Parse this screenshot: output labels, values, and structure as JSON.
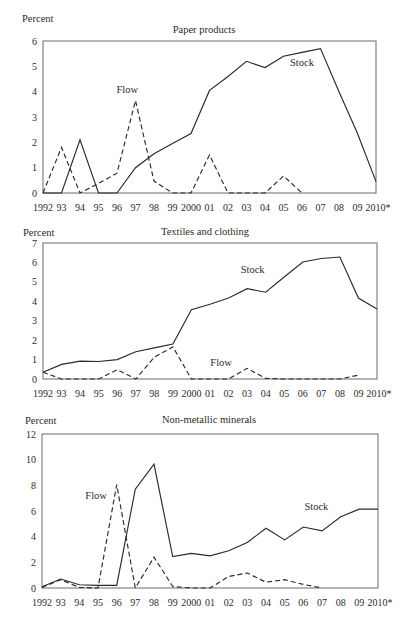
{
  "chart_data": [
    {
      "type": "line",
      "title": "Paper products",
      "xlabel": "",
      "ylabel": "Percent",
      "ylim": [
        0,
        6
      ],
      "yticks": [
        0,
        1,
        2,
        3,
        4,
        5,
        6
      ],
      "grid": false,
      "categories": [
        "1992",
        "93",
        "94",
        "95",
        "96",
        "97",
        "98",
        "99",
        "2000",
        "01",
        "02",
        "03",
        "04",
        "05",
        "06",
        "07",
        "08",
        "09",
        "2010*"
      ],
      "series": [
        {
          "name": "Stock",
          "style": "solid",
          "values": [
            0,
            0,
            2.1,
            0,
            0,
            1.0,
            1.55,
            1.95,
            2.35,
            4.05,
            4.6,
            5.2,
            4.95,
            5.4,
            5.55,
            5.7,
            4.0,
            2.35,
            0.45
          ]
        },
        {
          "name": "Flow",
          "style": "dashed",
          "values": [
            0,
            1.8,
            0,
            0.38,
            0.78,
            3.65,
            0.47,
            0,
            0,
            1.5,
            0,
            0,
            0,
            0.67,
            0,
            null,
            null,
            null,
            null
          ]
        }
      ],
      "annotations": [
        {
          "text": "Flow",
          "x_index": 4.55,
          "y": 3.95
        },
        {
          "text": "Stock",
          "x_index": 14.0,
          "y": 5.02
        }
      ]
    },
    {
      "type": "line",
      "title": "Textiles and clothing",
      "xlabel": "",
      "ylabel": "Percent",
      "ylim": [
        0,
        7
      ],
      "yticks": [
        0,
        1,
        2,
        3,
        4,
        5,
        6,
        7
      ],
      "grid": false,
      "categories": [
        "1992",
        "93",
        "94",
        "95",
        "96",
        "97",
        "98",
        "99",
        "2000",
        "01",
        "02",
        "03",
        "04",
        "05",
        "06",
        "07",
        "08",
        "09",
        "2010*"
      ],
      "series": [
        {
          "name": "Stock",
          "style": "solid",
          "values": [
            0.35,
            0.75,
            0.92,
            0.9,
            1.0,
            1.4,
            1.6,
            1.8,
            3.56,
            3.85,
            4.17,
            4.65,
            4.47,
            5.25,
            6.02,
            6.2,
            6.28,
            4.17,
            3.6
          ]
        },
        {
          "name": "Flow",
          "style": "dashed",
          "values": [
            0.35,
            0,
            0,
            0,
            0.48,
            0,
            1.12,
            1.65,
            0,
            0,
            0,
            0.55,
            0.03,
            0,
            0,
            0,
            0,
            0.2,
            null
          ]
        }
      ],
      "annotations": [
        {
          "text": "Stock",
          "x_index": 11.3,
          "y": 5.46
        },
        {
          "text": "Flow",
          "x_index": 9.6,
          "y": 0.67
        }
      ]
    },
    {
      "type": "line",
      "title": "Non-metallic minerals",
      "xlabel": "",
      "ylabel": "Percent",
      "ylim": [
        0,
        12
      ],
      "yticks": [
        0,
        2,
        4,
        6,
        8,
        10,
        12
      ],
      "grid": false,
      "categories": [
        "1992",
        "93",
        "94",
        "95",
        "96",
        "97",
        "98",
        "99",
        "2000",
        "01",
        "02",
        "03",
        "04",
        "05",
        "06",
        "07",
        "08",
        "09",
        "2010*"
      ],
      "series": [
        {
          "name": "Stock",
          "style": "solid",
          "values": [
            0.1,
            0.7,
            0.25,
            0.2,
            0.2,
            7.7,
            9.65,
            2.45,
            2.7,
            2.5,
            2.9,
            3.55,
            4.65,
            3.75,
            4.75,
            4.45,
            5.55,
            6.15,
            6.15
          ]
        },
        {
          "name": "Flow",
          "style": "dashed",
          "values": [
            0.05,
            0.65,
            0.05,
            0,
            8.05,
            0,
            2.4,
            0.12,
            0,
            0,
            0.9,
            1.17,
            0.45,
            0.65,
            0.28,
            0,
            null,
            null,
            null
          ]
        }
      ],
      "annotations": [
        {
          "text": "Flow",
          "x_index": 2.9,
          "y": 6.94
        },
        {
          "text": "Stock",
          "x_index": 14.7,
          "y": 6.08
        }
      ]
    }
  ]
}
